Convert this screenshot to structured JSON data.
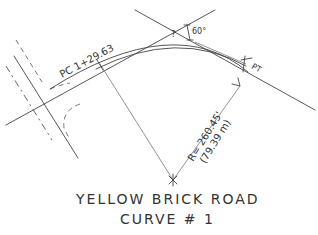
{
  "diagram": {
    "type": "horizontal-curve-sketch",
    "title_line1": "YELLOW BRICK ROAD",
    "title_line2": "CURVE # 1",
    "labels": {
      "pc": "PC 1+29.63",
      "pt": "PT",
      "delta_unknown": "?",
      "deflection_angle": "60°",
      "radius_ft": "R= 260.45'",
      "radius_m": "(79.39 m)"
    },
    "colors": {
      "ink": "#444444",
      "background": "#ffffff"
    }
  }
}
